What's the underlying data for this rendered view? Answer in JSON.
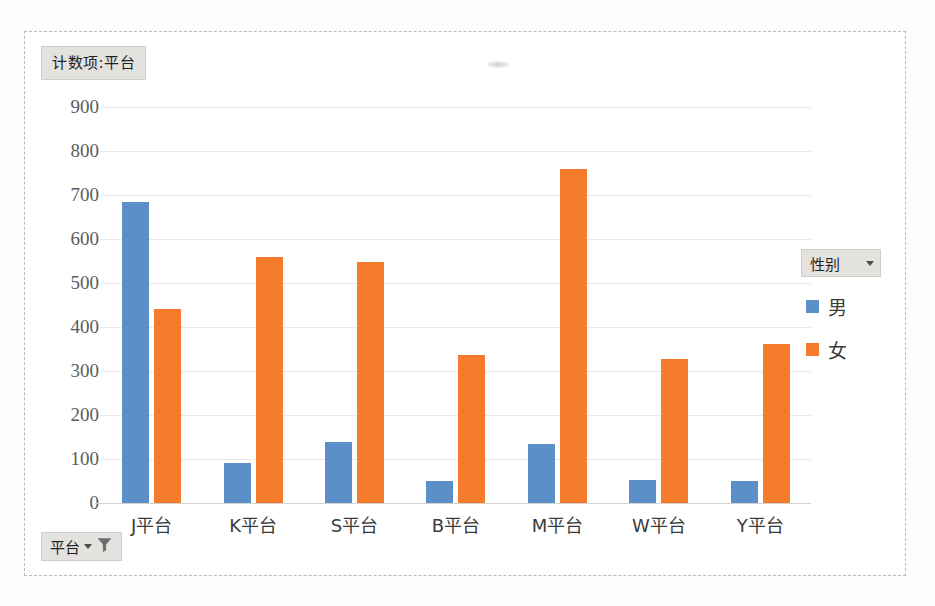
{
  "value_field": {
    "label": "计数项:平台",
    "icon": "chevron-down-icon"
  },
  "filter_field": {
    "label": "平台",
    "caret_icon": "chevron-down-icon",
    "filter_icon": "funnel-filter-icon"
  },
  "legend": {
    "title": "性别",
    "dropdown_icon": "chevron-down-icon",
    "items": [
      {
        "label": "男",
        "color": "#5b8fc7"
      },
      {
        "label": "女",
        "color": "#f47c2c"
      }
    ]
  },
  "colors": {
    "male": "#5b8fc7",
    "female": "#f47c2c",
    "grid": "#ebeae6",
    "frame": "#b9b9b9",
    "field_button": "#e3e2de"
  },
  "chart_data": {
    "type": "bar",
    "title": "计数项:平台",
    "xlabel": "",
    "ylabel": "",
    "categories": [
      "J平台",
      "K平台",
      "S平台",
      "B平台",
      "M平台",
      "W平台",
      "Y平台"
    ],
    "series": [
      {
        "name": "男",
        "color": "#5b8fc7",
        "values": [
          685,
          91,
          138,
          50,
          134,
          52,
          49
        ]
      },
      {
        "name": "女",
        "color": "#f47c2c",
        "values": [
          440,
          560,
          547,
          337,
          758,
          327,
          361
        ]
      }
    ],
    "ylim": [
      0,
      900
    ],
    "yticks": [
      900,
      800,
      700,
      600,
      500,
      400,
      300,
      200,
      100,
      0
    ],
    "grid": true,
    "legend_position": "right",
    "legend_title": "性别"
  }
}
